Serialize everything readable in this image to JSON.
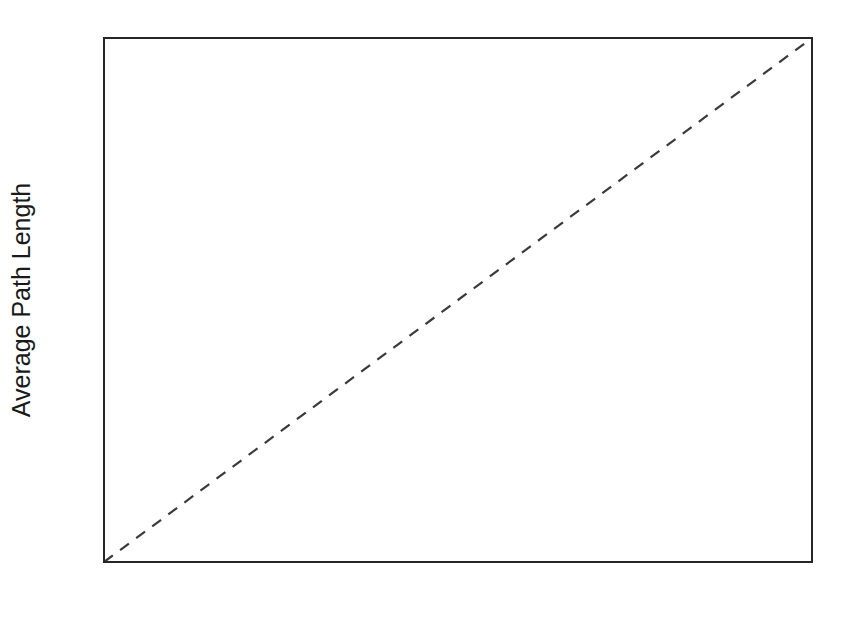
{
  "figure": {
    "background_color": "#ffffff",
    "marker_color": "#2b2b33",
    "axis_color": "#262626",
    "reference_line_color": "#3a3a3a"
  },
  "chart_data": {
    "type": "scatter",
    "title": "",
    "xlabel": "ln (n)",
    "xlabel_main": "ln (",
    "xlabel_italic": "n",
    "xlabel_close": ")",
    "ylabel": "Average Path Length",
    "xlim": [
      0,
      20
    ],
    "ylim": [
      0,
      20
    ],
    "grid": false,
    "legend": false,
    "xticks": [
      0,
      2,
      4,
      6,
      8,
      10,
      12,
      14,
      16,
      18,
      20
    ],
    "xtick_labels": [
      "0",
      "2",
      "4",
      "6",
      "8",
      "10",
      "12",
      "14",
      "16",
      "18",
      "20"
    ],
    "xticks_minor": [
      1,
      3,
      5,
      7,
      9,
      11,
      13,
      15,
      17,
      19
    ],
    "yticks": [
      0,
      2,
      4,
      6,
      8,
      10,
      12,
      14,
      16,
      18,
      20
    ],
    "ytick_labels": [
      "0",
      "2",
      "4",
      "6",
      "8",
      "10",
      "12",
      "14",
      "16",
      "18",
      "20"
    ],
    "yticks_minor": [
      1,
      3,
      5,
      7,
      9,
      11,
      13,
      15,
      17,
      19
    ],
    "marker": "open-circle",
    "marker_size": 6,
    "points": [
      {
        "x": 4.5,
        "y": 1.9
      },
      {
        "x": 4.9,
        "y": 2.05
      },
      {
        "x": 5.75,
        "y": 3.95
      },
      {
        "x": 6.35,
        "y": 16.0
      },
      {
        "x": 6.4,
        "y": 2.15
      },
      {
        "x": 6.75,
        "y": 2.5
      },
      {
        "x": 6.8,
        "y": 4.25
      },
      {
        "x": 6.9,
        "y": 4.85
      },
      {
        "x": 7.2,
        "y": 1.5
      },
      {
        "x": 7.3,
        "y": 2.4
      },
      {
        "x": 7.6,
        "y": 6.8
      },
      {
        "x": 8.55,
        "y": 19.0
      },
      {
        "x": 9.2,
        "y": 3.3
      },
      {
        "x": 9.3,
        "y": 5.2
      },
      {
        "x": 9.35,
        "y": 4.55
      },
      {
        "x": 10.0,
        "y": 11.05
      },
      {
        "x": 10.9,
        "y": 6.2
      },
      {
        "x": 11.0,
        "y": 4.95
      },
      {
        "x": 12.45,
        "y": 7.55
      },
      {
        "x": 12.55,
        "y": 11.25
      },
      {
        "x": 13.1,
        "y": 3.45
      },
      {
        "x": 14.3,
        "y": 4.9
      },
      {
        "x": 19.2,
        "y": 16.1
      }
    ],
    "reference_line": {
      "label": "y = x",
      "style": "dashed",
      "from": [
        0,
        0
      ],
      "to": [
        20,
        20
      ]
    },
    "annotations": [
      {
        "text": "Large-World",
        "x": 3.6,
        "y": 12.15
      },
      {
        "text": "Small-World",
        "x": 13.6,
        "y": 7.35
      }
    ]
  }
}
